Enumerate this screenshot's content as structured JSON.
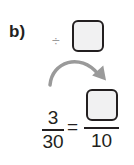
{
  "problem": {
    "label": "b)",
    "operator_symbol": "÷",
    "operator_name": "divide",
    "left_fraction": {
      "numerator": "3",
      "denominator": "30"
    },
    "equals": "=",
    "right_fraction": {
      "numerator": "",
      "denominator": "10"
    },
    "operator_box_value": "",
    "arrow_icon": "curved-arrow-right-down"
  },
  "colors": {
    "text": "#231f20",
    "operator": "#9a9a9a",
    "arrow": "#9a9a9a",
    "box_fill": "#f1f1f2",
    "box_border": "#231f20"
  }
}
